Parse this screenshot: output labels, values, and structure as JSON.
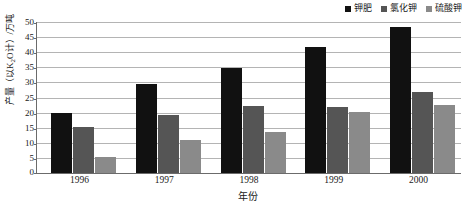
{
  "chart_data": {
    "type": "bar",
    "title": "",
    "xlabel": "年份",
    "ylabel": "产量（以K2O计）/万吨",
    "ylabel_parts": {
      "prefix": "产量（以K",
      "sub": "2",
      "suffix": "O计）/万吨"
    },
    "categories": [
      "1996",
      "1997",
      "1998",
      "1999",
      "2000"
    ],
    "series": [
      {
        "name": "钾肥",
        "color": "#111111",
        "values": [
          20.0,
          29.5,
          34.7,
          41.8,
          48.4
        ]
      },
      {
        "name": "氯化钾",
        "color": "#555555",
        "values": [
          15.1,
          19.3,
          22.2,
          21.9,
          26.7
        ]
      },
      {
        "name": "硫酸钾",
        "color": "#8a8a8a",
        "values": [
          5.2,
          11.0,
          13.6,
          20.1,
          22.6
        ]
      }
    ],
    "ylim": [
      0,
      50
    ],
    "yticks": [
      50,
      45,
      40,
      35,
      30,
      25,
      20,
      15,
      10,
      5,
      0
    ],
    "ytick_labels": [
      "50",
      "45",
      "40",
      "35",
      "30",
      "25",
      "20",
      "15",
      "10",
      "5",
      "0"
    ],
    "grid": true,
    "legend_position": "top-right",
    "gridline_color": "#b4b4b4",
    "axis_color": "#6b6b6b"
  }
}
